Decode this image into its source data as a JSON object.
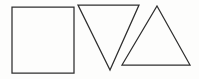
{
  "canvas": {
    "width": 199,
    "height": 79,
    "background_color": "#fdfdfc",
    "stroke_color": "#2e2e2e",
    "stroke_width": 1.25,
    "description": "Three hand-drawn black outline geometric shapes on a white background: a square, a downward-pointing triangle, and an upward-pointing triangle."
  },
  "shapes": [
    {
      "id": "square",
      "name": "square",
      "type": "rectangle",
      "fill": "none",
      "stroke_color": "#2e2e2e",
      "points": "12,7 74,7 74,73 12,73",
      "bbox": {
        "x": 12,
        "y": 7,
        "width": 62,
        "height": 66
      }
    },
    {
      "id": "triangle-down",
      "name": "downward-pointing triangle",
      "type": "triangle",
      "orientation": "down",
      "fill": "none",
      "stroke_color": "#2e2e2e",
      "points": "78,5 139,5 110,70",
      "bbox": {
        "x": 78,
        "y": 5,
        "width": 61,
        "height": 65
      }
    },
    {
      "id": "triangle-up",
      "name": "upward-pointing triangle",
      "type": "triangle",
      "orientation": "up",
      "fill": "none",
      "stroke_color": "#2e2e2e",
      "points": "157,6 190,65 122,65",
      "bbox": {
        "x": 122,
        "y": 6,
        "width": 68,
        "height": 59
      }
    }
  ]
}
